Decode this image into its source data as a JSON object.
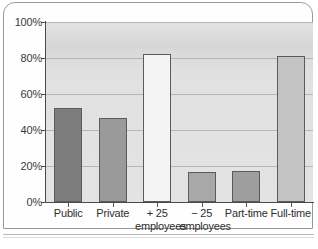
{
  "chart_data": {
    "type": "bar",
    "title": "",
    "xlabel": "",
    "ylabel": "",
    "ylim": [
      0,
      100
    ],
    "ytick_labels": [
      "0%",
      "20%",
      "40%",
      "60%",
      "80%",
      "100%"
    ],
    "ytick_values": [
      0,
      20,
      40,
      60,
      80,
      100
    ],
    "grid": true,
    "legend": "none",
    "categories": [
      "Public",
      "Private",
      "+ 25 employees",
      "− 25 employees",
      "Part-time",
      "Full-time"
    ],
    "category_lines": [
      [
        "Public",
        ""
      ],
      [
        "Private",
        ""
      ],
      [
        "+ 25",
        "employees"
      ],
      [
        "− 25",
        "employees"
      ],
      [
        "Part-time",
        ""
      ],
      [
        "Full-time",
        ""
      ]
    ],
    "values": [
      52,
      46.5,
      82,
      16.5,
      17.5,
      81
    ],
    "value_labels": [
      "52%",
      "46%",
      "82%",
      "17%",
      "18%",
      "81%"
    ],
    "bar_colors": [
      "#7d7d7d",
      "#9a9a9a",
      "#f4f4f4",
      "#a8a8a8",
      "#9e9e9e",
      "#c3c3c3"
    ]
  },
  "axis": {
    "y_unit": "%",
    "x_baseline_label": ""
  },
  "colors": {
    "plot_background": "#e2e2e2",
    "gridline": "#b5b5b5",
    "axis": "#4a4a4a",
    "bar_outline": "#5b5b5b",
    "page_frame": "#9a9a9a",
    "text": "#2e2e2e"
  }
}
